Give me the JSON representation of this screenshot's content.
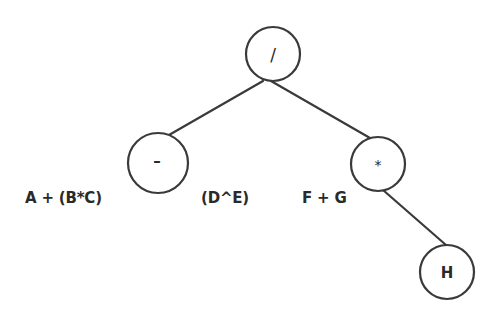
{
  "diagram": {
    "type": "expression-tree",
    "nodes": [
      {
        "id": "root",
        "label": "/",
        "cx": 273,
        "cy": 54,
        "r": 27
      },
      {
        "id": "minus",
        "label": "–",
        "cx": 158,
        "cy": 163,
        "r": 30
      },
      {
        "id": "times",
        "label": "*",
        "cx": 378,
        "cy": 164,
        "r": 27
      },
      {
        "id": "h",
        "label": "H",
        "cx": 447,
        "cy": 272,
        "r": 27
      }
    ],
    "edges": [
      {
        "from": "root",
        "to": "minus"
      },
      {
        "from": "root",
        "to": "times"
      },
      {
        "from": "times",
        "to": "h"
      }
    ],
    "floating_labels": [
      {
        "id": "a-plus-bc",
        "text": "A + (B*C)",
        "x": 25,
        "y": 189
      },
      {
        "id": "d-pow-e",
        "text": "(D^E)",
        "x": 201,
        "y": 189
      },
      {
        "id": "f-plus-g",
        "text": "F + G",
        "x": 302,
        "y": 189
      }
    ],
    "colors": {
      "stroke": "#3a3a3a",
      "text": "#2a2a2a",
      "background": "#ffffff"
    }
  }
}
